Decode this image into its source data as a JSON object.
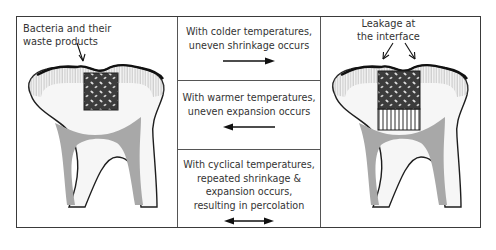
{
  "left_panel": {
    "label": "Bacteria and their\nwaste products",
    "tooth_state": "intact-restoration"
  },
  "center_panel": {
    "steps": [
      {
        "text": "With colder temperatures,\nuneven shrinkage occurs",
        "arrow": "right-arrow"
      },
      {
        "text": "With warmer temperatures,\nuneven expansion occurs",
        "arrow": "left-arrow"
      },
      {
        "text": "With cyclical temperatures,\nrepeated shrinkage &\nexpansion occurs,\nresulting in percolation",
        "arrow": "double-arrow"
      }
    ]
  },
  "right_panel": {
    "label": "Leakage at\nthe interface",
    "tooth_state": "leaking-restoration"
  },
  "colors": {
    "border": "#3a3a3a",
    "pulp": "#a8a8a8",
    "filling": "#3c3c3c",
    "enamel_lines": "#9a9a9a",
    "text": "#333333"
  }
}
